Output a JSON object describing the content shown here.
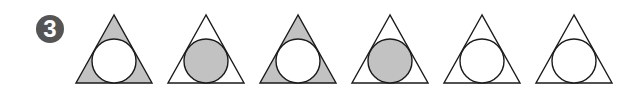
{
  "problem": {
    "number_label": "3",
    "badge_color": "#555555"
  },
  "colors": {
    "shade": "#c2c2c2",
    "stroke": "#1a1a1a",
    "white": "#ffffff"
  },
  "figures": [
    {
      "index": 1,
      "corners_shaded": true,
      "circle_shaded": false
    },
    {
      "index": 2,
      "corners_shaded": false,
      "circle_shaded": true
    },
    {
      "index": 3,
      "corners_shaded": true,
      "circle_shaded": false
    },
    {
      "index": 4,
      "corners_shaded": false,
      "circle_shaded": true
    },
    {
      "index": 5,
      "corners_shaded": false,
      "circle_shaded": false
    },
    {
      "index": 6,
      "corners_shaded": false,
      "circle_shaded": false
    }
  ]
}
